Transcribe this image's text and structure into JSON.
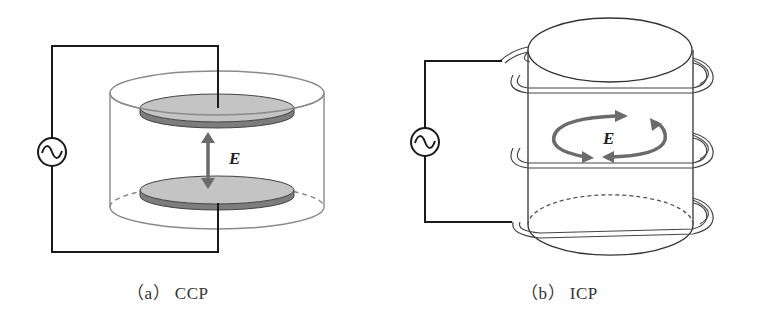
{
  "figure": {
    "panels": [
      {
        "id": "a",
        "caption": "（a） CCP",
        "field_label": "E",
        "description": "Capacitively coupled plasma: two parallel disc electrodes in a cylindrical chamber driven by an AC source, vertical electric field between plates"
      },
      {
        "id": "b",
        "caption": "（b） ICP",
        "field_label": "E",
        "description": "Inductively coupled plasma: coil wound around cylindrical chamber driven by an AC source, circulating electric field inside"
      }
    ],
    "source_symbol": "~",
    "colors": {
      "wire": "#1a1a1a",
      "chamber": "#8a8a8a",
      "plate_top": "#c4c4c4",
      "plate_edge": "#7a7a7a",
      "arrow": "#6b6b6b",
      "coil": "#555555"
    }
  }
}
